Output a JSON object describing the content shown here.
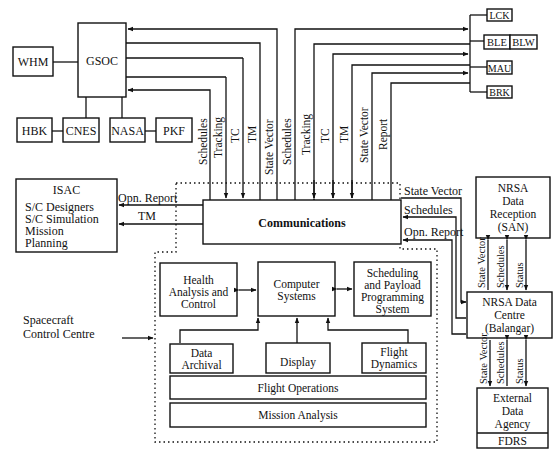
{
  "diagram": {
    "type": "block-diagram",
    "nodes": {
      "whm": "WHM",
      "gsoc": "GSOC",
      "hbk": "HBK",
      "cnes": "CNES",
      "nasa": "NASA",
      "pkf": "PKF",
      "lck": "LCK",
      "ble": "BLE",
      "blw": "BLW",
      "mau": "MAU",
      "brk": "BRK",
      "isac": {
        "title": "ISAC",
        "lines": [
          "S/C Designers",
          "S/C Simulation",
          "Mission",
          "Planning"
        ]
      },
      "communications": "Communications",
      "health": [
        "Health",
        "Analysis and",
        "Control"
      ],
      "computer": [
        "Computer",
        "Systems"
      ],
      "scheduling": [
        "Scheduling",
        "and Payload",
        "Programming",
        "System"
      ],
      "archival": [
        "Data",
        "Archival"
      ],
      "display": "Display",
      "flight_dynamics": [
        "Flight",
        "Dynamics"
      ],
      "flight_operations": "Flight Operations",
      "mission_analysis": "Mission Analysis",
      "nrsa_reception": [
        "NRSA",
        "Data",
        "Reception",
        "(SAN)"
      ],
      "nrsa_centre": [
        "NRSA Data",
        "Centre",
        "(Balangar)"
      ],
      "external": [
        "External",
        "Data",
        "Agency"
      ],
      "fdrs": "FDRS",
      "scc_label": [
        "Spacecraft",
        "Control Centre"
      ]
    },
    "links": {
      "gsoc_side": [
        "Schedules",
        "Tracking",
        "TC",
        "TM",
        "State Vector"
      ],
      "stations_side": [
        "Schedules",
        "Tracking",
        "TC",
        "TM",
        "State Vector",
        "Report"
      ],
      "isac_side": [
        "Opn. Report",
        "TM"
      ],
      "nrsa_side": [
        "State Vector",
        "Schedules",
        "Opn. Report"
      ],
      "reception_centre": [
        "State Vector",
        "Schedules",
        "Status"
      ],
      "centre_external": [
        "State Vector",
        "Schedules",
        "Status"
      ]
    }
  }
}
